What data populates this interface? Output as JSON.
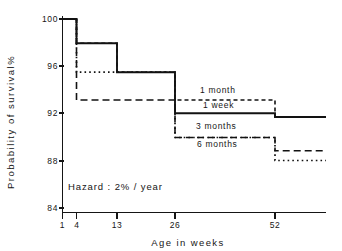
{
  "chart_data": {
    "type": "line",
    "subtype": "step-survival-curves",
    "title": "",
    "xlabel": "Age in weeks",
    "ylabel": "Probability of survival%",
    "annotation": "Hazard : 2% / year",
    "xscale": "custom-ordinal",
    "grid": false,
    "legend_position": "inline-on-plot",
    "xticks": [
      1,
      4,
      13,
      26,
      52
    ],
    "xticklabels": [
      "1",
      "4",
      "13",
      "26",
      "52"
    ],
    "yticks": [
      84,
      88,
      92,
      96,
      100
    ],
    "yticklabels": [
      "84",
      "88",
      "92",
      "96",
      "100"
    ],
    "xlim": [
      1,
      60
    ],
    "ylim": [
      84,
      100
    ],
    "series": [
      {
        "name": "1 month",
        "style": "dash-dot",
        "label_text": "1 month",
        "steps": [
          {
            "x_start": 1,
            "x_end": 4,
            "y": 100.0
          },
          {
            "x_start": 4,
            "x_end": 13,
            "y": 98.0
          },
          {
            "x_start": 13,
            "x_end": 26,
            "y": 95.6
          },
          {
            "x_start": 26,
            "x_end": 52,
            "y": 93.3
          },
          {
            "x_start": 52,
            "x_end": 60,
            "y": 91.9
          }
        ]
      },
      {
        "name": "1 week",
        "style": "dashed",
        "label_text": "1 week",
        "steps": [
          {
            "x_start": 1,
            "x_end": 4,
            "y": 100.0
          },
          {
            "x_start": 4,
            "x_end": 26,
            "y": 93.3
          },
          {
            "x_start": 26,
            "x_end": 52,
            "y": 90.2
          },
          {
            "x_start": 52,
            "x_end": 60,
            "y": 89.1
          }
        ]
      },
      {
        "name": "3 months",
        "style": "solid",
        "label_text": "3 months",
        "steps": [
          {
            "x_start": 1,
            "x_end": 4,
            "y": 100.0
          },
          {
            "x_start": 4,
            "x_end": 13,
            "y": 98.0
          },
          {
            "x_start": 13,
            "x_end": 26,
            "y": 95.6
          },
          {
            "x_start": 26,
            "x_end": 52,
            "y": 92.2
          },
          {
            "x_start": 52,
            "x_end": 60,
            "y": 91.9
          }
        ]
      },
      {
        "name": "6 months",
        "style": "dotted",
        "label_text": "6 months",
        "steps": [
          {
            "x_start": 1,
            "x_end": 4,
            "y": 100.0
          },
          {
            "x_start": 4,
            "x_end": 26,
            "y": 95.6
          },
          {
            "x_start": 26,
            "x_end": 52,
            "y": 90.2
          },
          {
            "x_start": 52,
            "x_end": 60,
            "y": 88.3
          }
        ]
      }
    ],
    "colors": {
      "ink": "#121212",
      "background": "#ffffff"
    }
  },
  "axes": {
    "ylabel": "Probability of survival%",
    "xlabel": "Age in weeks",
    "y_tick_0": "84",
    "y_tick_1": "88",
    "y_tick_2": "92",
    "y_tick_3": "96",
    "y_tick_4": "100",
    "x_tick_0": "1",
    "x_tick_1": "4",
    "x_tick_2": "13",
    "x_tick_3": "26",
    "x_tick_4": "52"
  },
  "annotations": {
    "hazard": "Hazard : 2% / year",
    "label_1_month": "1 month",
    "label_1_week": "1 week",
    "label_3_months": "3 months",
    "label_6_months": "6 months"
  }
}
